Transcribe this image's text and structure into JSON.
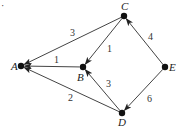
{
  "diagram": {
    "type": "weighted-directed-graph",
    "marker": "·",
    "nodes": [
      {
        "id": "A",
        "label": "A",
        "x": 21,
        "y": 66,
        "lx": 11,
        "ly": 70
      },
      {
        "id": "B",
        "label": "B",
        "x": 83,
        "y": 67,
        "lx": 77,
        "ly": 81
      },
      {
        "id": "C",
        "label": "C",
        "x": 124,
        "y": 16,
        "lx": 121,
        "ly": 10
      },
      {
        "id": "D",
        "label": "D",
        "x": 122,
        "y": 113,
        "lx": 118,
        "ly": 126
      },
      {
        "id": "E",
        "label": "E",
        "x": 165,
        "y": 67,
        "lx": 169,
        "ly": 71
      }
    ],
    "edges": [
      {
        "from": "C",
        "to": "A",
        "weight": "3",
        "lx": 70,
        "ly": 36
      },
      {
        "from": "B",
        "to": "A",
        "weight": "1",
        "lx": 54,
        "ly": 63
      },
      {
        "from": "D",
        "to": "A",
        "weight": "2",
        "lx": 68,
        "ly": 101
      },
      {
        "from": "C",
        "to": "B",
        "weight": "1",
        "lx": 107,
        "ly": 52
      },
      {
        "from": "D",
        "to": "B",
        "weight": "3",
        "lx": 106,
        "ly": 87
      },
      {
        "from": "E",
        "to": "C",
        "weight": "4",
        "lx": 148,
        "ly": 40
      },
      {
        "from": "E",
        "to": "D",
        "weight": "6",
        "lx": 147,
        "ly": 102
      }
    ]
  }
}
